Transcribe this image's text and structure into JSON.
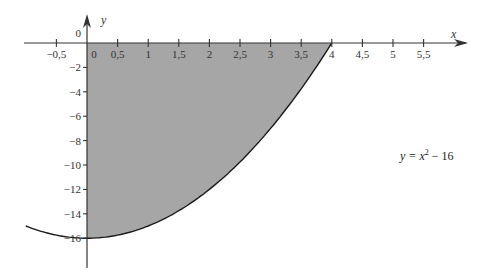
{
  "chart_data": {
    "type": "area",
    "title": "",
    "xlabel": "x",
    "ylabel": "y",
    "annotation": "y = x² − 16",
    "function": "y = x^2 - 16",
    "shaded_region": {
      "x_from": 0,
      "x_to": 4,
      "between": "curve and x-axis"
    },
    "x_ticks": [
      -0.5,
      0,
      0.5,
      1,
      1.5,
      2,
      2.5,
      3,
      3.5,
      4,
      4.5,
      5,
      5.5
    ],
    "x_tick_labels": [
      "−0,5",
      "0",
      "0,5",
      "1",
      "1,5",
      "2",
      "2,5",
      "3",
      "3,5",
      "4",
      "4,5",
      "5",
      "5,5"
    ],
    "y_ticks": [
      0,
      -2,
      -4,
      -6,
      -8,
      -10,
      -12,
      -14,
      -16
    ],
    "y_tick_labels": [
      "0",
      "−2",
      "−4",
      "−6",
      "−8",
      "−10",
      "−12",
      "−14",
      "−16"
    ],
    "xlim": [
      -1.0,
      6.2
    ],
    "ylim": [
      -18.5,
      3
    ],
    "x": [
      -1.0,
      -0.5,
      0,
      0.5,
      1,
      1.5,
      2,
      2.5,
      3,
      3.5,
      4
    ],
    "values": [
      -15,
      -15.75,
      -16,
      -15.75,
      -15,
      -13.75,
      -12,
      -9.75,
      -7,
      -3.75,
      0
    ],
    "grid": false,
    "colors": {
      "fill": "#a6a6a6",
      "curve": "#1a1a1a",
      "axis": "#333333"
    }
  },
  "labels": {
    "x_axis": "x",
    "y_axis": "y",
    "equation_lhs": "y = x",
    "equation_exp": "2",
    "equation_rhs": " − 16"
  }
}
